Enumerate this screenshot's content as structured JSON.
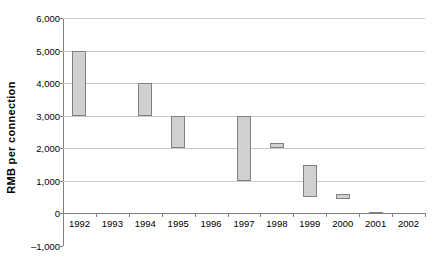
{
  "chart_data": {
    "type": "bar",
    "subtype": "floating-range-bar",
    "title": "",
    "xlabel": "",
    "ylabel": "RMB  per  connection",
    "categories": [
      "1992",
      "1993",
      "1994",
      "1995",
      "1996",
      "1997",
      "1998",
      "1999",
      "2000",
      "2001",
      "2002"
    ],
    "ylim": [
      -1000,
      6000
    ],
    "ytick_values": [
      6000,
      5000,
      4000,
      3000,
      2000,
      1000,
      0,
      -1000
    ],
    "ytick_labels": [
      "6,000",
      "5,000",
      "4,000",
      "3,000",
      "2,000",
      "1,000",
      "0",
      "–1,000"
    ],
    "grid": true,
    "gridlines_at": [
      6000,
      5000,
      4000,
      3000,
      2000,
      1000,
      0
    ],
    "legend": "none",
    "ranges": [
      {
        "category": "1992",
        "low": 3000,
        "high": 5000
      },
      {
        "category": "1993",
        "low": null,
        "high": null
      },
      {
        "category": "1994",
        "low": 3000,
        "high": 4000
      },
      {
        "category": "1995",
        "low": 2000,
        "high": 3000
      },
      {
        "category": "1996",
        "low": null,
        "high": null
      },
      {
        "category": "1997",
        "low": 1000,
        "high": 3000
      },
      {
        "category": "1998",
        "low": 2000,
        "high": 2150
      },
      {
        "category": "1999",
        "low": 500,
        "high": 1500
      },
      {
        "category": "2000",
        "low": 450,
        "high": 600
      },
      {
        "category": "2001",
        "low": 0,
        "high": 50
      },
      {
        "category": "2002",
        "low": null,
        "high": null
      }
    ],
    "series": [
      {
        "name": "low",
        "values": [
          3000,
          null,
          3000,
          2000,
          null,
          1000,
          2000,
          500,
          450,
          0,
          null
        ]
      },
      {
        "name": "high",
        "values": [
          5000,
          null,
          4000,
          3000,
          null,
          3000,
          2150,
          1500,
          600,
          50,
          null
        ]
      }
    ],
    "colors": {
      "bar_fill": "#d0d0d0",
      "bar_border": "#808080",
      "gridline": "#c8c8c8",
      "axis": "#808080",
      "text": "#000000",
      "background": "#ffffff"
    }
  }
}
